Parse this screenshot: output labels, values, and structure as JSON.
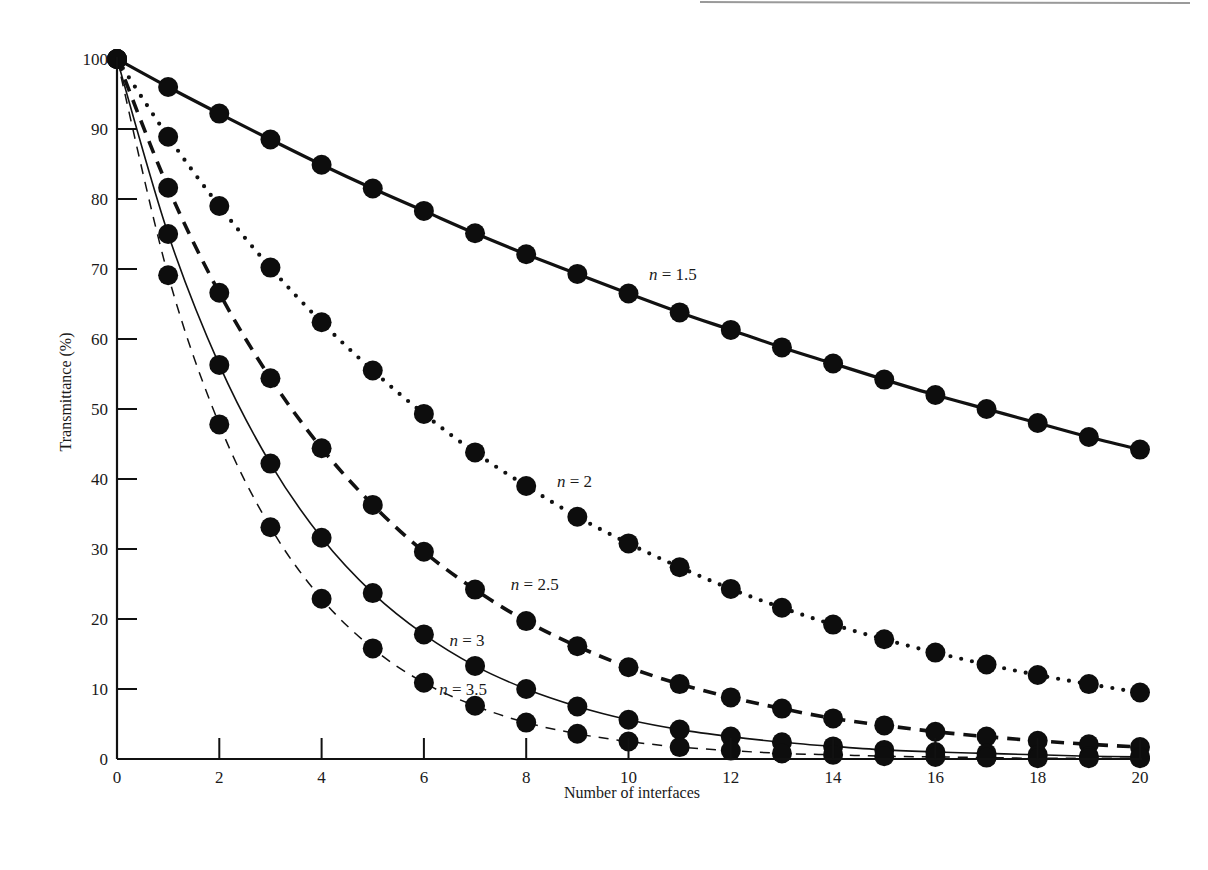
{
  "chart_data": {
    "type": "line",
    "title": "",
    "xlabel": "Number of interfaces",
    "ylabel": "Transmittance (%)",
    "xlim": [
      0,
      20
    ],
    "ylim": [
      0,
      100
    ],
    "x_ticks": [
      0,
      2,
      4,
      6,
      8,
      10,
      12,
      14,
      16,
      18,
      20
    ],
    "y_ticks": [
      0,
      10,
      20,
      30,
      40,
      50,
      60,
      70,
      80,
      90,
      100
    ],
    "grid": false,
    "legend": "inline labels on curves",
    "x": [
      0,
      1,
      2,
      3,
      4,
      5,
      6,
      7,
      8,
      9,
      10,
      11,
      12,
      13,
      14,
      15,
      16,
      17,
      18,
      19,
      20
    ],
    "series": [
      {
        "name": "n = 1.5",
        "label_prefix": "n",
        "label_value": "= 1.5",
        "line_style": "solid-thick",
        "values": [
          100,
          96.0,
          92.2,
          88.5,
          84.9,
          81.5,
          78.3,
          75.1,
          72.1,
          69.3,
          66.5,
          63.8,
          61.3,
          58.8,
          56.5,
          54.2,
          52.0,
          50.0,
          48.0,
          46.0,
          44.2
        ]
      },
      {
        "name": "n = 2",
        "label_prefix": "n",
        "label_value": "= 2",
        "line_style": "dotted",
        "values": [
          100,
          88.9,
          79.0,
          70.2,
          62.4,
          55.5,
          49.3,
          43.8,
          39.0,
          34.6,
          30.8,
          27.4,
          24.3,
          21.6,
          19.2,
          17.1,
          15.2,
          13.5,
          12.0,
          10.7,
          9.5
        ]
      },
      {
        "name": "n = 2.5",
        "label_prefix": "n",
        "label_value": "= 2.5",
        "line_style": "dashed-thick",
        "values": [
          100,
          81.6,
          66.6,
          54.4,
          44.4,
          36.3,
          29.6,
          24.2,
          19.7,
          16.1,
          13.1,
          10.7,
          8.8,
          7.2,
          5.8,
          4.8,
          3.9,
          3.2,
          2.6,
          2.1,
          1.7
        ]
      },
      {
        "name": "n = 3",
        "label_prefix": "n",
        "label_value": "= 3",
        "line_style": "solid-thin",
        "values": [
          100,
          75.0,
          56.3,
          42.2,
          31.6,
          23.7,
          17.8,
          13.3,
          10.0,
          7.5,
          5.6,
          4.2,
          3.2,
          2.4,
          1.8,
          1.3,
          1.0,
          0.8,
          0.6,
          0.4,
          0.3
        ]
      },
      {
        "name": "n = 3.5",
        "label_prefix": "n",
        "label_value": "= 3.5",
        "line_style": "dashed-thin",
        "values": [
          100,
          69.1,
          47.8,
          33.1,
          22.9,
          15.8,
          10.9,
          7.6,
          5.2,
          3.6,
          2.5,
          1.7,
          1.2,
          0.8,
          0.6,
          0.4,
          0.3,
          0.2,
          0.1,
          0.1,
          0.1
        ]
      }
    ],
    "annotations": [
      {
        "series": "n = 1.5",
        "x": 10.4,
        "y": 68.5
      },
      {
        "series": "n = 2",
        "x": 8.6,
        "y": 38.8
      },
      {
        "series": "n = 2.5",
        "x": 7.7,
        "y": 24.2
      },
      {
        "series": "n = 3",
        "x": 6.5,
        "y": 16.2
      },
      {
        "series": "n = 3.5",
        "x": 6.3,
        "y": 9.2
      }
    ]
  }
}
